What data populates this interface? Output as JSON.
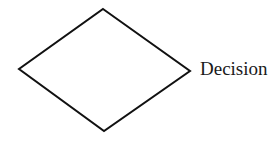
{
  "diagram": {
    "shape": "decision-diamond",
    "stroke_color": "#111111",
    "fill_color": "#ffffff",
    "label": "Decision"
  }
}
